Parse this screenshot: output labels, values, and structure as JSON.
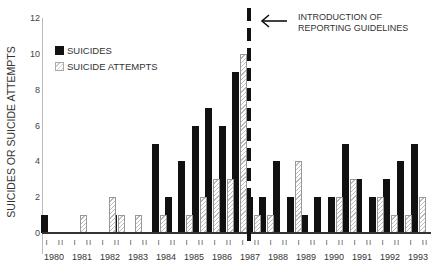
{
  "chart_data": {
    "type": "bar",
    "title": "",
    "xlabel": "",
    "ylabel": "SUICIDES OR SUICIDE ATTEMPTS",
    "ylim": [
      0,
      12
    ],
    "yticks": [
      "0",
      "2",
      "4",
      "6",
      "8",
      "10",
      "12"
    ],
    "grid": false,
    "legend_position": "upper-left",
    "x_years": [
      "1980",
      "1981",
      "1982",
      "1983",
      "1984",
      "1985",
      "1986",
      "1987",
      "1988",
      "1989",
      "1990",
      "1991",
      "1992",
      "1993"
    ],
    "half_year_labels": [
      "I",
      "II"
    ],
    "bar_positions_px": [
      45,
      76,
      105,
      114,
      131,
      156,
      169,
      182,
      196,
      209,
      223,
      236,
      250,
      263,
      277,
      291,
      305,
      318,
      332,
      346,
      359,
      373,
      387,
      401,
      415
    ],
    "series": [
      {
        "name": "SUICIDES",
        "color": "#111111",
        "values": [
          1,
          0,
          0,
          1,
          0,
          5,
          2,
          4,
          6,
          7,
          6,
          9,
          2,
          2,
          4,
          2,
          1,
          2,
          2,
          5,
          3,
          2,
          3,
          4,
          5
        ]
      },
      {
        "name": "SUICIDE ATTEMPTS",
        "color": "#ffffff",
        "pattern": "hatched",
        "values": [
          0,
          1,
          2,
          1,
          1,
          1,
          0,
          1,
          2,
          3,
          3,
          10,
          1,
          1,
          0,
          4,
          0,
          0,
          2,
          3,
          0,
          2,
          1,
          1,
          2
        ]
      }
    ],
    "annotations": [
      {
        "text": "INTRODUCTION OF REPORTING GUIDELINES",
        "x": "1987",
        "style": "dashed vertical line with left arrow"
      }
    ]
  },
  "legend": {
    "suicides": "SUICIDES",
    "attempts": "SUICIDE ATTEMPTS"
  },
  "annotation": {
    "line1": "INTRODUCTION OF",
    "line2": "REPORTING GUIDELINES"
  }
}
